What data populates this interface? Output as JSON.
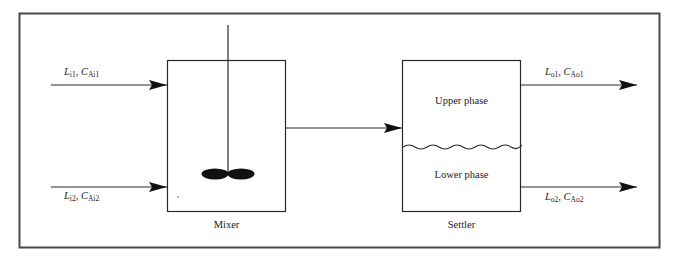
{
  "diagram": {
    "colors": {
      "line": "#2a2a2a",
      "frame": "#4a4a4a",
      "background": "#ffffff"
    },
    "streams": {
      "inlet1": {
        "L": "L",
        "L_sub": "i1",
        "C": "C",
        "C_sub": "Ai1",
        "sep": ", "
      },
      "inlet2": {
        "L": "L",
        "L_sub": "i2",
        "C": "C",
        "C_sub": "Ai2",
        "sep": ", "
      },
      "outlet1": {
        "L": "L",
        "L_sub": "o1",
        "C": "C",
        "C_sub": "Ao1",
        "sep": ", "
      },
      "outlet2": {
        "L": "L",
        "L_sub": "o2",
        "C": "C",
        "C_sub": "Ao2",
        "sep": ", "
      }
    },
    "units": {
      "mixer": {
        "label": "Mixer"
      },
      "settler": {
        "label": "Settler",
        "upper_phase": "Upper phase",
        "lower_phase": "Lower phase"
      }
    }
  }
}
